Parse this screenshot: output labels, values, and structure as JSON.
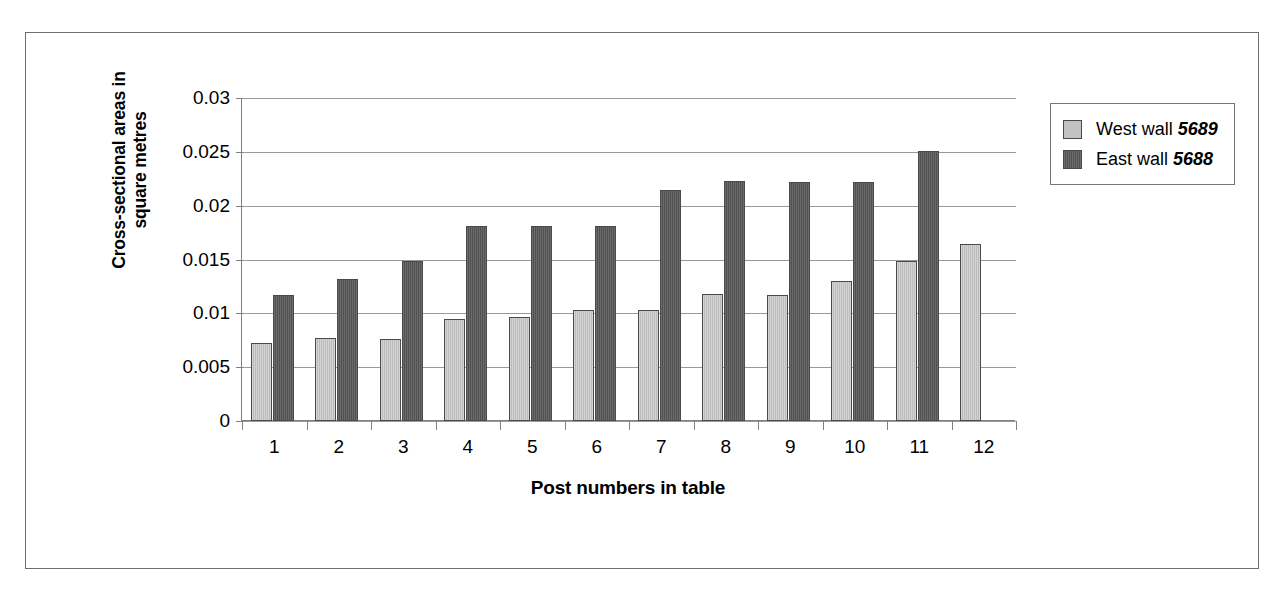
{
  "figure": {
    "frame_border_color": "#6e6e6e",
    "background": "#ffffff"
  },
  "axes": {
    "y_title_line1": "Cross-sectional areas in",
    "y_title_line2": "square metres",
    "x_title": "Post numbers in table",
    "y_ticks": [
      "0",
      "0.005",
      "0.01",
      "0.015",
      "0.02",
      "0.025",
      "0.03"
    ],
    "x_ticks": [
      "1",
      "2",
      "3",
      "4",
      "5",
      "6",
      "7",
      "8",
      "9",
      "10",
      "11",
      "12"
    ]
  },
  "legend": {
    "position": "right",
    "entries": [
      {
        "label": "West wall",
        "code": "5689",
        "color": "#c2c2c2"
      },
      {
        "label": "East wall",
        "code": "5688",
        "color": "#5a5a5a"
      }
    ]
  },
  "chart_data": {
    "type": "bar",
    "title": "",
    "xlabel": "Post numbers in table",
    "ylabel": "Cross-sectional areas in square metres",
    "categories": [
      "1",
      "2",
      "3",
      "4",
      "5",
      "6",
      "7",
      "8",
      "9",
      "10",
      "11",
      "12"
    ],
    "ylim": [
      0,
      0.03
    ],
    "ytick_values": [
      0,
      0.005,
      0.01,
      0.015,
      0.02,
      0.025,
      0.03
    ],
    "grid": true,
    "series": [
      {
        "name": "West wall 5689",
        "color": "#c2c2c2",
        "values": [
          0.0072,
          0.0077,
          0.0076,
          0.0095,
          0.0097,
          0.0103,
          0.0103,
          0.0118,
          0.0117,
          0.013,
          0.0149,
          0.0164
        ]
      },
      {
        "name": "East wall 5688",
        "color": "#5a5a5a",
        "values": [
          0.0117,
          0.0132,
          0.0149,
          0.0181,
          0.0181,
          0.0181,
          0.0215,
          0.0223,
          0.0222,
          0.0222,
          0.0251,
          null
        ]
      }
    ]
  }
}
